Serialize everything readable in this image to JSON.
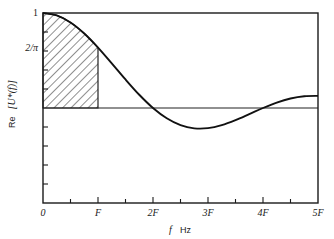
{
  "chart_data": {
    "type": "line",
    "title": "",
    "xlabel": "f Hz",
    "xlabel_parts": {
      "var": "f",
      "unit": "Hz"
    },
    "ylabel": "Re [U*(f)]",
    "ylabel_parts": {
      "prefix": "Re",
      "expr": "[U*(f)]"
    },
    "x_unit": "F",
    "xlim": [
      0,
      5
    ],
    "ylim": [
      -1,
      1
    ],
    "grid": false,
    "legend": null,
    "x_tick_labels": [
      "0",
      "F",
      "2F",
      "3F",
      "4F",
      "5F"
    ],
    "x_major_ticks": [
      0,
      1,
      2,
      3,
      4,
      5
    ],
    "x_minor_ticks": [
      0.5,
      1.5,
      2.5,
      3.5,
      4.5
    ],
    "y_tick_labels": [
      {
        "value": 1,
        "label": "1"
      },
      {
        "value": 0.6366,
        "label": "2/π"
      }
    ],
    "y_ticks": [
      0.8,
      0.6,
      0.4,
      0.2,
      -0.2,
      -0.4,
      -0.6,
      -0.8
    ],
    "reference_line": {
      "y": 0
    },
    "shaded_region": {
      "x_from": 0,
      "x_to": 1,
      "style": "diagonal-hatch",
      "under": "curve"
    },
    "series": [
      {
        "name": "Re [U*(f)]",
        "x": [
          0,
          0.25,
          0.5,
          0.75,
          1,
          1.25,
          1.5,
          1.75,
          2,
          2.25,
          2.5,
          2.75,
          3,
          3.25,
          3.5,
          3.75,
          4,
          4.25,
          4.5,
          4.75,
          5
        ],
        "values": [
          1,
          0.9745,
          0.9003,
          0.7842,
          0.6366,
          0.4705,
          0.3001,
          0.1392,
          0,
          -0.1083,
          -0.1801,
          -0.2139,
          -0.2122,
          -0.181,
          -0.1286,
          -0.065,
          0,
          0.0573,
          0.1,
          0.1238,
          0.1273
        ]
      }
    ],
    "colors": {
      "line": "#111111",
      "axes": "#1a1a1a",
      "background": "#ffffff"
    }
  }
}
